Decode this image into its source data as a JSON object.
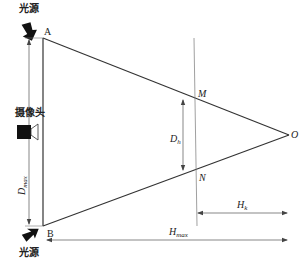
{
  "diagram": {
    "title": "",
    "points": {
      "A": "A",
      "B": "B",
      "M": "M",
      "N": "N",
      "O": "O"
    },
    "labels": {
      "light_source_top": "光源",
      "light_source_bottom": "光源",
      "camera": "摄像头",
      "d_max_main": "D",
      "d_max_sub": "max",
      "d_h_main": "D",
      "d_h_sub": "h",
      "h_k_main": "H",
      "h_k_sub": "k",
      "h_max_main": "H",
      "h_max_sub": "max"
    },
    "colors": {
      "line": "#333333",
      "thin_line": "#777777",
      "arrow_fill": "#111111"
    }
  }
}
